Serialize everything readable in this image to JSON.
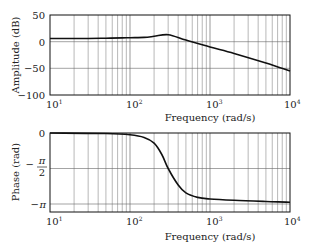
{
  "chart_data": [
    {
      "type": "line",
      "title": "",
      "xlabel": "Frequency (rad/s)",
      "ylabel": "Amplitude (dB)",
      "xscale": "log",
      "xlim": [
        10,
        10000
      ],
      "ylim": [
        -100,
        50
      ],
      "xticks": [
        "10^1",
        "10^2",
        "10^3",
        "10^4"
      ],
      "yticks": [
        "50",
        "0",
        "-50",
        "-100"
      ],
      "grid": true,
      "series": [
        {
          "name": "Amplitude",
          "x": [
            10,
            30,
            50,
            80,
            100,
            150,
            200,
            300,
            500,
            1000,
            2000,
            5000,
            10000
          ],
          "values": [
            6,
            6,
            6.5,
            7,
            7.5,
            8,
            10,
            13,
            3,
            -10,
            -22,
            -40,
            -55
          ]
        }
      ]
    },
    {
      "type": "line",
      "title": "",
      "xlabel": "Frequency (rad/s)",
      "ylabel": "Phase (rad)",
      "xscale": "log",
      "xlim": [
        10,
        10000
      ],
      "ylim": [
        -3.4,
        0
      ],
      "xticks": [
        "10^1",
        "10^2",
        "10^3",
        "10^4"
      ],
      "yticks": [
        "0",
        "-π/2",
        "-π"
      ],
      "grid": true,
      "series": [
        {
          "name": "Phase",
          "x": [
            10,
            50,
            100,
            150,
            200,
            250,
            300,
            400,
            500,
            700,
            1000,
            2000,
            5000,
            10000
          ],
          "values": [
            0,
            -0.02,
            -0.08,
            -0.2,
            -0.45,
            -0.95,
            -1.57,
            -2.3,
            -2.65,
            -2.85,
            -2.92,
            -2.98,
            -3.03,
            -3.06
          ]
        }
      ]
    }
  ],
  "labels": {
    "amp_ylabel": "Amplitude (dB)",
    "phase_ylabel": "Phase (rad)",
    "xlabel": "Frequency (rad/s)",
    "amp_yticks": [
      "50",
      "0",
      "−50",
      "−100"
    ],
    "xticks": [
      "10",
      "10",
      "10",
      "10"
    ],
    "xtick_exps": [
      "1",
      "2",
      "3",
      "4"
    ],
    "phase_y0": "0",
    "phase_ypi_num": "π",
    "phase_ypi_den": "2",
    "phase_ypi": "π"
  }
}
